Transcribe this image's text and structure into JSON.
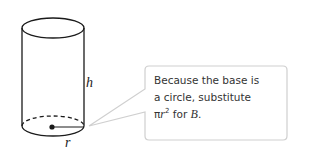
{
  "figure": {
    "labels": {
      "height": "h",
      "radius": "r"
    },
    "callout": {
      "line1": "Because the base is",
      "line2": "a circle, substitute",
      "line3_pi": "π",
      "line3_r": "r",
      "line3_exp": "2",
      "line3_mid": " for ",
      "line3_B": "B",
      "line3_end": "."
    },
    "colors": {
      "stroke": "#1a1a1a",
      "callout_border": "#cfcfcf"
    }
  }
}
